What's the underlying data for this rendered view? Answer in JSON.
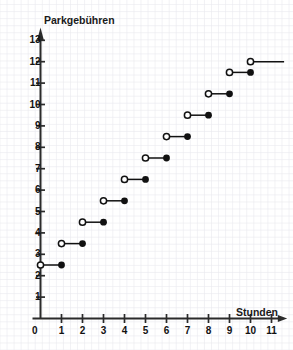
{
  "chart_data": {
    "type": "line",
    "subtype": "step-function",
    "title": "",
    "ylabel": "Parkgebühren",
    "xlabel": "Stunden",
    "xlim": [
      0,
      11.6
    ],
    "ylim": [
      0,
      13.4
    ],
    "xticks": [
      1,
      2,
      3,
      4,
      5,
      6,
      7,
      8,
      9,
      10,
      11
    ],
    "yticks": [
      1,
      2,
      3,
      4,
      5,
      6,
      7,
      8,
      9,
      10,
      11,
      12,
      13
    ],
    "origin_label": "0",
    "grid": true,
    "legend": null,
    "steps": [
      {
        "x_start": 0,
        "x_end": 1,
        "y": 2.5,
        "left_endpoint": "open",
        "right_endpoint": "closed"
      },
      {
        "x_start": 1,
        "x_end": 2,
        "y": 3.5,
        "left_endpoint": "open",
        "right_endpoint": "closed"
      },
      {
        "x_start": 2,
        "x_end": 3,
        "y": 4.5,
        "left_endpoint": "open",
        "right_endpoint": "closed"
      },
      {
        "x_start": 3,
        "x_end": 4,
        "y": 5.5,
        "left_endpoint": "open",
        "right_endpoint": "closed"
      },
      {
        "x_start": 4,
        "x_end": 5,
        "y": 6.5,
        "left_endpoint": "open",
        "right_endpoint": "closed"
      },
      {
        "x_start": 5,
        "x_end": 6,
        "y": 7.5,
        "left_endpoint": "open",
        "right_endpoint": "closed"
      },
      {
        "x_start": 6,
        "x_end": 7,
        "y": 8.5,
        "left_endpoint": "open",
        "right_endpoint": "closed"
      },
      {
        "x_start": 7,
        "x_end": 8,
        "y": 9.5,
        "left_endpoint": "open",
        "right_endpoint": "closed"
      },
      {
        "x_start": 8,
        "x_end": 9,
        "y": 10.5,
        "left_endpoint": "open",
        "right_endpoint": "closed"
      },
      {
        "x_start": 9,
        "x_end": 10,
        "y": 11.5,
        "left_endpoint": "open",
        "right_endpoint": "closed"
      },
      {
        "x_start": 10,
        "x_end": 11.6,
        "y": 12,
        "left_endpoint": "open",
        "right_endpoint": "none"
      }
    ],
    "colors": {
      "axis": "#2b2b2b",
      "series": "#111111",
      "grid_minor": "#e9e9ee",
      "grid_major": "#d4d4de",
      "background": "#ffffff"
    }
  }
}
